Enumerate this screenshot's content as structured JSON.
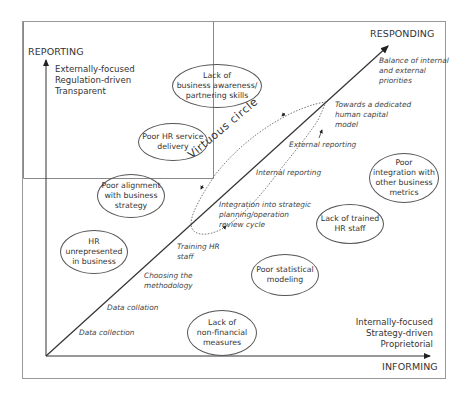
{
  "axes": {
    "y_label": "REPORTING",
    "x_label": "INFORMING",
    "diagonal_label": "RESPONDING"
  },
  "quadrant_text": {
    "top_left": [
      "Externally-focused",
      "Regulation-driven",
      "Transparent"
    ],
    "bottom_right": [
      "Internally-focused",
      "Strategy-driven",
      "Proprietorial"
    ]
  },
  "diagonal_steps": [
    "Data collection",
    "Data collation",
    "Choosing the\nmethodology",
    "Training HR\nstaff",
    "Integration into strategic\nplanning/operation\nreview cycle",
    "Internal reporting",
    "External reporting",
    "Towards a dedicated\nhuman capital\nmodel",
    "Balance of internal\nand external\npriorities"
  ],
  "virtuous_circle_label": "Virtuous circle",
  "barriers_upper": [
    "Lack of\nbusiness awareness/\npartnering skills",
    "Poor HR service\ndelivery",
    "Poor alignment\nwith business\nstrategy",
    "HR\nunrepresented\nin business"
  ],
  "barriers_lower": [
    "Poor\nintegration with\nother business\nmetrics",
    "Lack of trained\nHR staff",
    "Poor statistical\nmodeling",
    "Lack of\nnon-financial\nmeasures"
  ]
}
